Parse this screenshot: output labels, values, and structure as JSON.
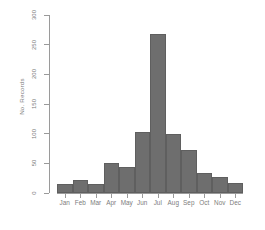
{
  "chart_data": {
    "type": "bar",
    "title": "",
    "xlabel": "",
    "ylabel": "No. Records",
    "categories": [
      "Jan",
      "Feb",
      "Mar",
      "Apr",
      "May",
      "Jun",
      "Jul",
      "Aug",
      "Sep",
      "Oct",
      "Nov",
      "Dec"
    ],
    "values": [
      15,
      22,
      15,
      51,
      44,
      103,
      268,
      100,
      73,
      34,
      27,
      17
    ],
    "ylim": [
      0,
      300
    ],
    "yticks": [
      0,
      50,
      100,
      150,
      200,
      250,
      300
    ],
    "ytick_labels": [
      "0",
      "50",
      "100",
      "150",
      "200",
      "250",
      "300"
    ],
    "grid": false,
    "legend": null,
    "bar_color": "#6e6e6e",
    "axis_color": "#9a9a9a",
    "text_color": "#7d7d7d",
    "background_color": "#ffffff"
  }
}
